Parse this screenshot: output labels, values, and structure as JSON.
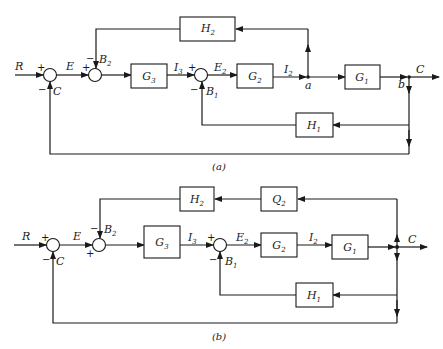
{
  "diagram_a": {
    "caption": "(a)",
    "signals": {
      "R": "R",
      "E": "E",
      "C_in": "C",
      "B2": "B",
      "B2_sub": "2",
      "I3": "I",
      "I3_sub": "3",
      "E2": "E",
      "E2_sub": "2",
      "B1": "B",
      "B1_sub": "1",
      "I2": "I",
      "I2_sub": "2",
      "a": "a",
      "b": "b",
      "C_out": "C"
    },
    "blocks": {
      "G3": {
        "name": "G",
        "sub": "3"
      },
      "G2": {
        "name": "G",
        "sub": "2"
      },
      "G1": {
        "name": "G",
        "sub": "1"
      },
      "H2": {
        "name": "H",
        "sub": "2"
      },
      "H1": {
        "name": "H",
        "sub": "1"
      }
    },
    "signs": {
      "s1_plus": "+",
      "s1_minus": "−",
      "s2_plus": "+",
      "s2_minus": "−",
      "s3_plus": "+",
      "s3_minus": "−"
    }
  },
  "diagram_b": {
    "caption": "(b)",
    "signals": {
      "R": "R",
      "E": "E",
      "C_in": "C",
      "B2": "B",
      "B2_sub": "2",
      "I3": "I",
      "I3_sub": "3",
      "E2": "E",
      "E2_sub": "2",
      "B1": "B",
      "B1_sub": "1",
      "I2": "I",
      "I2_sub": "2",
      "C_out": "C"
    },
    "blocks": {
      "G3": {
        "name": "G",
        "sub": "3"
      },
      "G2": {
        "name": "G",
        "sub": "2"
      },
      "G1": {
        "name": "G",
        "sub": "1"
      },
      "H2": {
        "name": "H",
        "sub": "2"
      },
      "Q2": {
        "name": "Q",
        "sub": "2"
      },
      "H1": {
        "name": "H",
        "sub": "1"
      }
    },
    "signs": {
      "s1_plus": "+",
      "s1_minus": "−",
      "s2_plus": "+",
      "s2_minus": "−",
      "s3_plus": "+",
      "s3_minus": "−"
    }
  }
}
